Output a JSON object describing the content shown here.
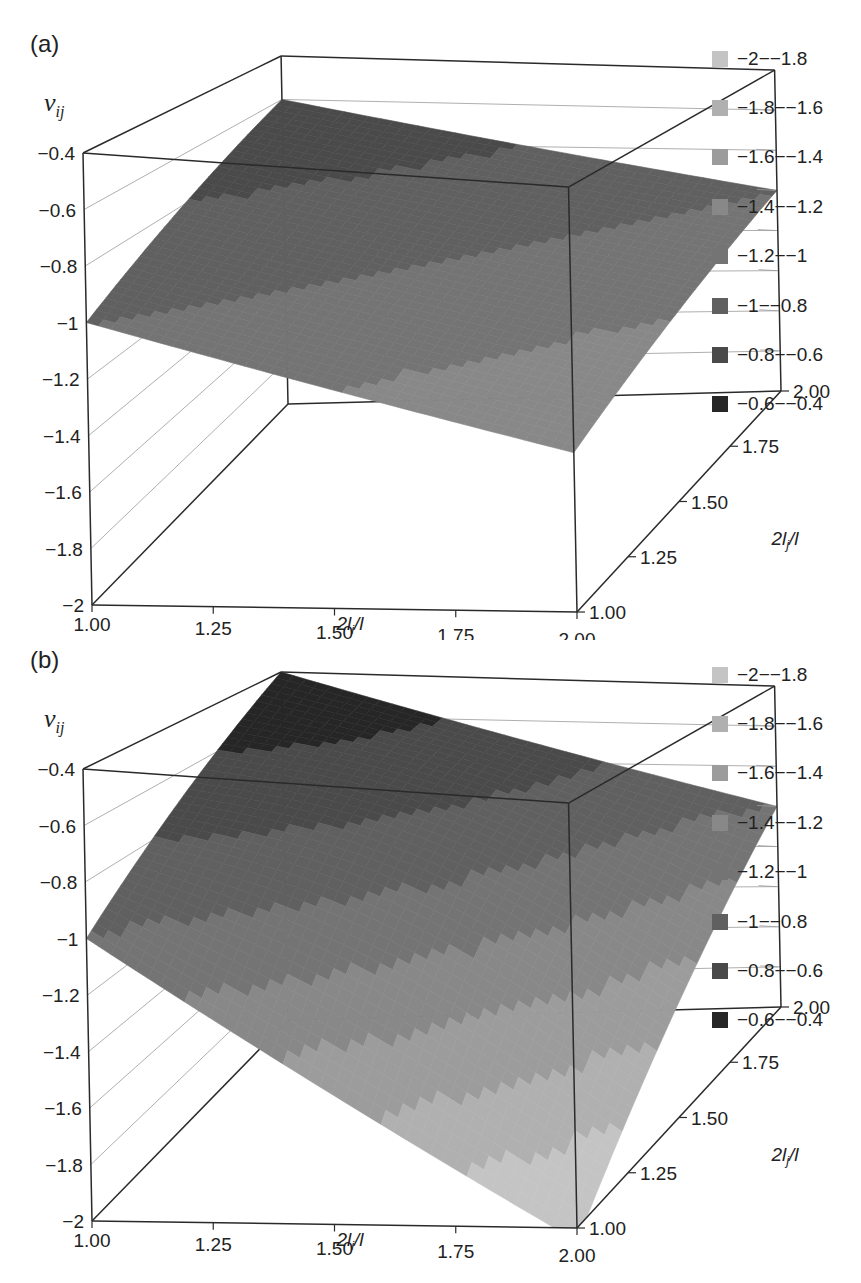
{
  "chart_data": [
    {
      "panel": "(a)",
      "type": "surface3d",
      "title": "",
      "zlabel": "ν_ij",
      "xlabel": "2l_i/l",
      "ylabel": "2l_j/l",
      "x_ticks": [
        "1.00",
        "1.25",
        "1.50",
        "1.75",
        "2.00"
      ],
      "y_ticks": [
        "1.00",
        "1.25",
        "1.50",
        "1.75",
        "2.00"
      ],
      "z_ticks": [
        "-0.4",
        "-0.6",
        "-0.8",
        "-1",
        "-1.2",
        "-1.4",
        "-1.6",
        "-1.8",
        "-2"
      ],
      "xlim": [
        1,
        2
      ],
      "ylim": [
        1,
        2
      ],
      "zlim": [
        -2,
        -0.4
      ],
      "surface_corners": [
        {
          "x": 1.0,
          "y": 1.0,
          "z": -1.0
        },
        {
          "x": 1.0,
          "y": 2.0,
          "z": -0.6
        },
        {
          "x": 2.0,
          "y": 2.0,
          "z": -1.0
        },
        {
          "x": 2.0,
          "y": 1.0,
          "z": -1.4
        }
      ],
      "legend": [
        "-2--1.8",
        "-1.8--1.6",
        "-1.6--1.4",
        "-1.4--1.2",
        "-1.2--1",
        "-1--0.8",
        "-0.8--0.6",
        "-0.6--0.4"
      ],
      "legend_colors": [
        "#c4c4c4",
        "#b0b0b0",
        "#9c9c9c",
        "#888888",
        "#747474",
        "#606060",
        "#4a4a4a",
        "#262626"
      ]
    },
    {
      "panel": "(b)",
      "type": "surface3d",
      "title": "",
      "zlabel": "ν_ij",
      "xlabel": "2l_i/l",
      "ylabel": "2l_j/l",
      "x_ticks": [
        "1.00",
        "1.25",
        "1.50",
        "1.75",
        "2.00"
      ],
      "y_ticks": [
        "1.00",
        "1.25",
        "1.50",
        "1.75",
        "2.00"
      ],
      "z_ticks": [
        "-0.4",
        "-0.6",
        "-0.8",
        "-1",
        "-1.2",
        "-1.4",
        "-1.6",
        "-1.8",
        "-2"
      ],
      "xlim": [
        1,
        2
      ],
      "ylim": [
        1,
        2
      ],
      "zlim": [
        -2,
        -0.4
      ],
      "surface_corners": [
        {
          "x": 1.0,
          "y": 1.0,
          "z": -1.0
        },
        {
          "x": 1.0,
          "y": 2.0,
          "z": -0.4
        },
        {
          "x": 2.0,
          "y": 2.0,
          "z": -1.0
        },
        {
          "x": 2.0,
          "y": 1.0,
          "z": -2.0
        }
      ],
      "legend": [
        "-2--1.8",
        "-1.8--1.6",
        "-1.6--1.4",
        "-1.4--1.2",
        "-1.2--1",
        "-1--0.8",
        "-0.8--0.6",
        "-0.6--0.4"
      ],
      "legend_colors": [
        "#c4c4c4",
        "#b0b0b0",
        "#9c9c9c",
        "#888888",
        "#747474",
        "#606060",
        "#4a4a4a",
        "#262626"
      ]
    }
  ],
  "panels": [
    {
      "label": "(a)",
      "zlabel_main": "ν",
      "zlabel_sub": "ij",
      "legend": [
        {
          "text": "−2−−1.8",
          "color": "#c4c4c4"
        },
        {
          "text": "−1.8−−1.6",
          "color": "#b0b0b0"
        },
        {
          "text": "−1.6−−1.4",
          "color": "#9c9c9c"
        },
        {
          "text": "−1.4−−1.2",
          "color": "#888888"
        },
        {
          "text": "−1.2−−1",
          "color": "#747474"
        },
        {
          "text": "−1−−0.8",
          "color": "#606060"
        },
        {
          "text": "−0.8−−0.6",
          "color": "#4a4a4a"
        },
        {
          "text": "−0.6−−0.4",
          "color": "#262626"
        }
      ]
    },
    {
      "label": "(b)",
      "zlabel_main": "ν",
      "zlabel_sub": "ij",
      "legend": [
        {
          "text": "−2−−1.8",
          "color": "#c4c4c4"
        },
        {
          "text": "−1.8−−1.6",
          "color": "#b0b0b0"
        },
        {
          "text": "−1.6−−1.4",
          "color": "#9c9c9c"
        },
        {
          "text": "−1.4−−1.2",
          "color": "#888888"
        },
        {
          "text": "−1.2−−1",
          "color": "#747474"
        },
        {
          "text": "−1−−0.8",
          "color": "#606060"
        },
        {
          "text": "−0.8−−0.6",
          "color": "#4a4a4a"
        },
        {
          "text": "−0.6−−0.4",
          "color": "#262626"
        }
      ]
    }
  ],
  "axes": {
    "z_tick_labels": [
      "−0.4",
      "−0.6",
      "−0.8",
      "−1",
      "−1.2",
      "−1.4",
      "−1.6",
      "−1.8",
      "−2"
    ],
    "x_tick_labels": [
      "1.00",
      "1.25",
      "1.50",
      "1.75",
      "2.00"
    ],
    "y_tick_labels": [
      "1.00",
      "1.25",
      "1.50",
      "1.75",
      "2.00"
    ],
    "x_title": "2l_i/l",
    "y_title": "2l_j/l"
  }
}
